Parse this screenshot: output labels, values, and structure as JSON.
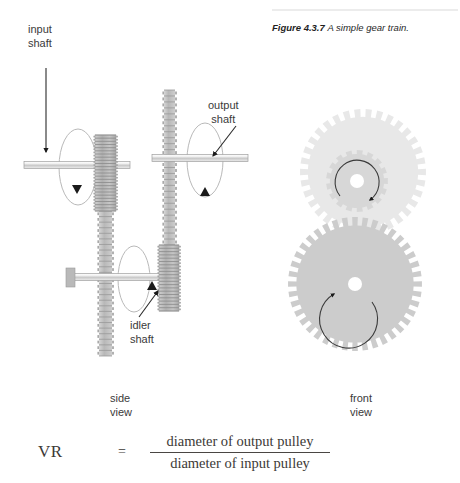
{
  "figure": {
    "label": "Figure 4.3.7",
    "caption": "A simple gear train."
  },
  "labels": {
    "input_shaft": "input\nshaft",
    "output_shaft": "output\nshaft",
    "idler_shaft": "idler\nshaft",
    "side_view": "side\nview",
    "front_view": "front\nview"
  },
  "formula": {
    "symbol": "VR",
    "equals": "=",
    "numerator": "diameter of output pulley",
    "denominator": "diameter of input pulley"
  },
  "diagram": {
    "side_view": {
      "shafts": [
        {
          "name": "input-shaft",
          "x1": 24,
          "x2": 130,
          "y": 165,
          "thickness": 7
        },
        {
          "name": "output-shaft",
          "x1": 152,
          "x2": 248,
          "y": 158,
          "thickness": 7
        },
        {
          "name": "idler-shaft",
          "x1": 68,
          "x2": 176,
          "y": 277,
          "thickness": 7
        }
      ],
      "gear_blocks": [
        {
          "name": "input-gear-block",
          "x": 95,
          "y": 135,
          "w": 21,
          "h": 76,
          "teeth": 24,
          "shade": "#b6b6b6"
        },
        {
          "name": "input-gear-column",
          "x": 99,
          "y": 211,
          "w": 13,
          "h": 145,
          "teeth": 26,
          "shade": "#c0c0c0"
        },
        {
          "name": "output-gear-column",
          "x": 164,
          "y": 90,
          "w": 11,
          "h": 155,
          "teeth": 26,
          "shade": "#c3c3c3"
        },
        {
          "name": "idler-gear-block",
          "x": 159,
          "y": 245,
          "w": 20,
          "h": 66,
          "teeth": 20,
          "shade": "#b6b6b6"
        }
      ],
      "rotation_ellipses": [
        {
          "name": "input-rotation-indicator",
          "cx": 78,
          "cy": 167,
          "rx": 19,
          "ry": 38
        },
        {
          "name": "output-rotation-indicator",
          "cx": 205,
          "cy": 160,
          "rx": 18,
          "ry": 37
        },
        {
          "name": "idler-rotation-indicator",
          "cx": 134,
          "cy": 279,
          "rx": 16,
          "ry": 33
        }
      ],
      "leader_arrows": [
        {
          "name": "input-shaft-leader",
          "x1": 46,
          "y1": 68,
          "x2": 46,
          "y2": 152
        },
        {
          "name": "output-shaft-leader",
          "x1": 233,
          "y1": 129,
          "x2": 213,
          "y2": 155
        },
        {
          "name": "idler-shaft-leader",
          "x1": 140,
          "y1": 318,
          "x2": 157,
          "y2": 292
        }
      ]
    },
    "front_view": {
      "gears": [
        {
          "name": "front-gear-input-large",
          "cx": 363,
          "cy": 172,
          "radius": 63,
          "teeth": 34,
          "fill": "#e8e8e8",
          "hub": 0
        },
        {
          "name": "front-gear-idler-small",
          "cx": 357,
          "cy": 181,
          "radius": 31,
          "teeth": 17,
          "fill": "#d7d7d7",
          "hub": 7
        },
        {
          "name": "front-gear-output-large",
          "cx": 355,
          "cy": 284,
          "radius": 67,
          "teeth": 40,
          "fill": "#cccccc",
          "hub": 7
        }
      ],
      "rotation_arrows": [
        {
          "name": "small-gear-rotation-arrow",
          "cx": 357,
          "cy": 181,
          "radius": 22
        },
        {
          "name": "large-gear-rotation-arrow",
          "cx": 355,
          "cy": 284,
          "radius": 29
        }
      ]
    }
  },
  "colors": {
    "ink": "#3a3a3a",
    "rule": "#d0d0d0",
    "gear_light": "#e8e8e8",
    "gear_mid": "#d7d7d7",
    "gear_dark": "#cccccc",
    "metal": "#b6b6b6"
  }
}
